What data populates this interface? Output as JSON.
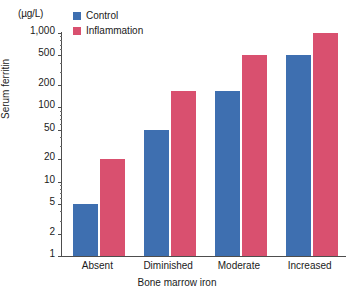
{
  "chart_data": {
    "type": "bar",
    "title": "",
    "xlabel": "Bone marrow iron",
    "ylabel": "Serum ferritin",
    "unit_label": "(µg/L)",
    "yscale": "log",
    "ylim": [
      1,
      1000
    ],
    "grid": false,
    "legend_position": "top-left",
    "categories": [
      "Absent",
      "Diminished",
      "Moderate",
      "Increased"
    ],
    "ytick_labels": [
      "1",
      "2",
      "5",
      "10",
      "20",
      "50",
      "100",
      "200",
      "500",
      "1,000"
    ],
    "ytick_values": [
      1,
      2,
      5,
      10,
      20,
      50,
      100,
      200,
      500,
      1000
    ],
    "series": [
      {
        "name": "Control",
        "color": "#3e6fb0",
        "values": [
          5,
          50,
          165,
          500
        ]
      },
      {
        "name": "Inflammation",
        "color": "#d9506f",
        "values": [
          20,
          165,
          500,
          1000
        ]
      }
    ]
  },
  "legend": {
    "items": [
      {
        "label": "Control"
      },
      {
        "label": "Inflammation"
      }
    ]
  }
}
